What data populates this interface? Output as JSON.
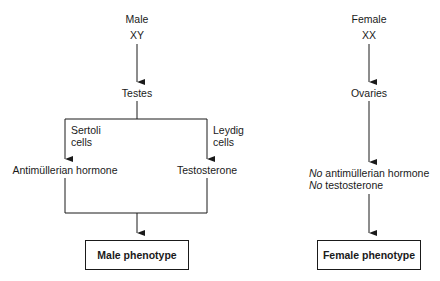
{
  "male": {
    "sex": "Male",
    "karyotype": "XY",
    "gonad": "Testes",
    "branch_left_cells": [
      "Sertoli",
      "cells"
    ],
    "branch_right_cells": [
      "Leydig",
      "cells"
    ],
    "hormone_left": "Antimüllerian hormone",
    "hormone_right": "Testosterone",
    "phenotype": "Male phenotype"
  },
  "female": {
    "sex": "Female",
    "karyotype": "XX",
    "gonad": "Ovaries",
    "hormone_line1_prefix": "No",
    "hormone_line1_rest": " antimüllerian hormone",
    "hormone_line2_prefix": "No",
    "hormone_line2_rest": " testosterone",
    "phenotype": "Female phenotype"
  },
  "colors": {
    "line": "#1a1a1a",
    "background": "#ffffff"
  }
}
